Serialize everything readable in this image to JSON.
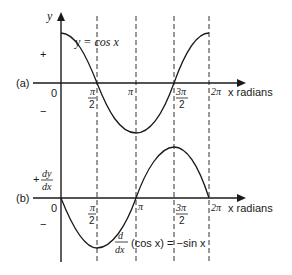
{
  "figure": {
    "panel_a": {
      "label": "(a)",
      "curve_label": "y = cos x",
      "y_axis_label": "y",
      "plus_sign": "+",
      "minus_sign": "−",
      "origin": "0",
      "x_axis_label": "x radians",
      "ticks": [
        {
          "num": "π",
          "den": "2"
        },
        {
          "num": "π",
          "den": ""
        },
        {
          "num": "3π",
          "den": "2"
        },
        {
          "num": "2π",
          "den": ""
        }
      ]
    },
    "panel_b": {
      "label": "(b)",
      "y_axis_label_num": "dy",
      "y_axis_label_den": "dx",
      "plus_sign": "+",
      "minus_sign": "−",
      "origin": "0",
      "x_axis_label": "x radians",
      "curve_label_num": "d",
      "curve_label_den": "dx",
      "curve_label_rest": "(cos x) = −sin x",
      "ticks": [
        {
          "num": "π",
          "den": "2"
        },
        {
          "num": "π",
          "den": ""
        },
        {
          "num": "3π",
          "den": "2"
        },
        {
          "num": "2π",
          "den": ""
        }
      ]
    }
  },
  "colors": {
    "stroke": "#1a1a1a",
    "background": "#ffffff"
  }
}
